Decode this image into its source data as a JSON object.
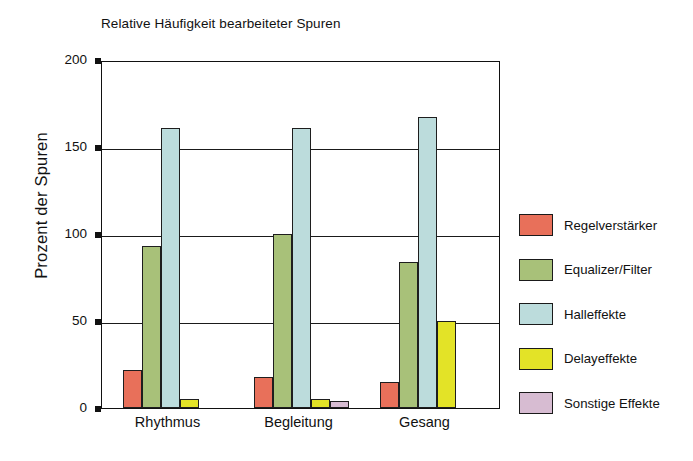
{
  "chart_data": {
    "type": "bar",
    "title": "Relative Häufigkeit bearbeiteter Spuren",
    "xlabel": "",
    "ylabel": "Prozent der Spuren",
    "categories": [
      "Rhythmus",
      "Begleitung",
      "Gesang"
    ],
    "ylim": [
      0,
      200
    ],
    "yticks": [
      0,
      50,
      100,
      150,
      200
    ],
    "ytick_labels": [
      "0",
      "50",
      "100",
      "150",
      "200"
    ],
    "grid": true,
    "legend_position": "right",
    "series": [
      {
        "name": "Regelverstärker",
        "color": "#e8705a",
        "values": [
          22,
          18,
          15
        ]
      },
      {
        "name": "Equalizer/Filter",
        "color": "#a8c179",
        "values": [
          93,
          100,
          84
        ]
      },
      {
        "name": "Halleffekte",
        "color": "#bcdcdc",
        "values": [
          161,
          161,
          167
        ]
      },
      {
        "name": "Delayeffekte",
        "color": "#e3e327",
        "values": [
          5,
          5,
          50
        ]
      },
      {
        "name": "Sonstige Effekte",
        "color": "#d7bcd2",
        "values": [
          0,
          4,
          0
        ]
      }
    ]
  },
  "colors": {
    "axis": "#111111",
    "grid": "#1a1a1a",
    "background": "#ffffff",
    "bar_outline": "#1e1e1e"
  }
}
